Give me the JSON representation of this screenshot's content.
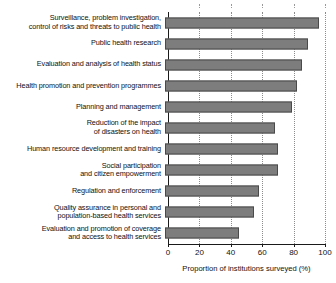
{
  "chart_data": {
    "type": "bar",
    "orientation": "horizontal",
    "title": "",
    "xlabel": "Proportion of institutions surveyed (%)",
    "ylabel": "",
    "xlim": [
      0,
      100
    ],
    "xticks": [
      0,
      20,
      40,
      60,
      80,
      100
    ],
    "xticklabels": [
      "0",
      "20",
      "40",
      "60",
      "80",
      "100"
    ],
    "grid": "vertical-dotted",
    "legend": "none",
    "bar_color": "#7d7d7d",
    "bar_edge_color": "#4a4a4a",
    "categories": [
      "Surveillance, problem investigation,\ncontrol of risks and threats to public health",
      "Public health research",
      "Evaluation and analysis of health status",
      "Health promotion and prevention programmes",
      "Planning and management",
      "Reduction of the impact\nof disasters on health",
      "Human resource development and training",
      "Social participation\nand citizen empowerment",
      "Regulation and enforcement",
      "Quality assurance in personal and\npopulation-based health services",
      "Evaluation and promotion of coverage\nand access to health services"
    ],
    "values": [
      98,
      91,
      87,
      84,
      81,
      70,
      72,
      72,
      60,
      57,
      47
    ]
  }
}
